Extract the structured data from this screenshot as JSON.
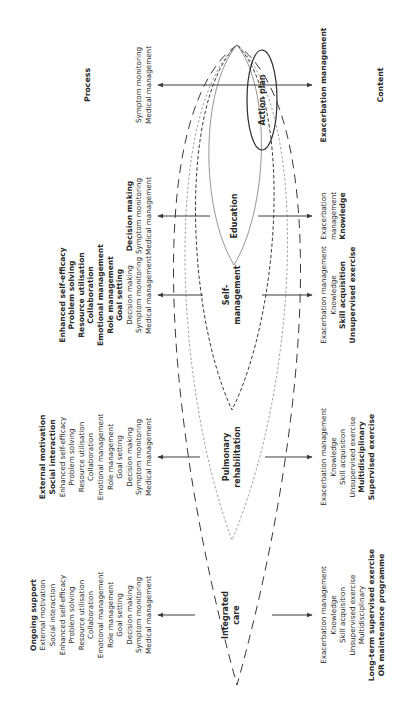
{
  "diagram": {
    "axis_labels": {
      "process": "Process",
      "content": "Content"
    },
    "levels": [
      {
        "id": "action-plan",
        "label_lines": [
          "Action plan"
        ],
        "process": [
          {
            "text": "Symptom monitoring",
            "bold": false
          },
          {
            "text": "Medical management",
            "bold": false
          }
        ],
        "content": [
          {
            "text": "Exacerbation management",
            "bold": true
          }
        ]
      },
      {
        "id": "education",
        "label_lines": [
          "Education"
        ],
        "process": [
          {
            "text": "Decision making",
            "bold": true
          },
          {
            "text": "Symptom monitoring",
            "bold": false
          },
          {
            "text": "Medical management",
            "bold": false
          }
        ],
        "content": [
          {
            "text": "Exacerbation",
            "bold": false
          },
          {
            "text": "management",
            "bold": false
          },
          {
            "text": "Knowledge",
            "bold": true
          }
        ]
      },
      {
        "id": "self-management",
        "label_lines": [
          "Self-",
          "management"
        ],
        "process": [
          {
            "text": "Enhanced self-efficacy",
            "bold": true
          },
          {
            "text": "Problem solving",
            "bold": true
          },
          {
            "text": "Resource utilisation",
            "bold": true
          },
          {
            "text": "Collaboration",
            "bold": true
          },
          {
            "text": "Emotional management",
            "bold": true
          },
          {
            "text": "Role management",
            "bold": true
          },
          {
            "text": "Goal setting",
            "bold": true
          },
          {
            "text": "Decision making",
            "bold": false
          },
          {
            "text": "Symptom monitoring",
            "bold": false
          },
          {
            "text": "Medical management",
            "bold": false
          }
        ],
        "content": [
          {
            "text": "Exacerbation management",
            "bold": false
          },
          {
            "text": "Knowledge",
            "bold": false
          },
          {
            "text": "Skill acquisition",
            "bold": true
          },
          {
            "text": "Unsupervised exercise",
            "bold": true
          }
        ]
      },
      {
        "id": "pulmonary-rehabilitation",
        "label_lines": [
          "Pulmonary",
          "rehabilitation"
        ],
        "process": [
          {
            "text": "External motivation",
            "bold": true
          },
          {
            "text": "Social interaction",
            "bold": true
          },
          {
            "text": "Enhanced self-efficacy",
            "bold": false
          },
          {
            "text": "Problem solving",
            "bold": false
          },
          {
            "text": "Resource utilisation",
            "bold": false
          },
          {
            "text": "Collaboration",
            "bold": false
          },
          {
            "text": "Emotional management",
            "bold": false
          },
          {
            "text": "Role management",
            "bold": false
          },
          {
            "text": "Goal setting",
            "bold": false
          },
          {
            "text": "Decision making",
            "bold": false
          },
          {
            "text": "Symptom monitoring",
            "bold": false
          },
          {
            "text": "Medical management",
            "bold": false
          }
        ],
        "content": [
          {
            "text": "Exacerbation management",
            "bold": false
          },
          {
            "text": "Knowledge",
            "bold": false
          },
          {
            "text": "Skill acquisition",
            "bold": false
          },
          {
            "text": "Unsupervised exercise",
            "bold": false
          },
          {
            "text": "Multidisciplinary",
            "bold": true
          },
          {
            "text": "Supervised exercise",
            "bold": true
          }
        ]
      },
      {
        "id": "integrated-care",
        "label_lines": [
          "Integrated",
          "care"
        ],
        "process": [
          {
            "text": "Ongoing support",
            "bold": true
          },
          {
            "text": "External motivation",
            "bold": false
          },
          {
            "text": "Social interaction",
            "bold": false
          },
          {
            "text": "Enhanced self-efficacy",
            "bold": false
          },
          {
            "text": "Problem solving",
            "bold": false
          },
          {
            "text": "Resource utilisation",
            "bold": false
          },
          {
            "text": "Collaboration",
            "bold": false
          },
          {
            "text": "Emotional management",
            "bold": false
          },
          {
            "text": "Role management",
            "bold": false
          },
          {
            "text": "Goal setting",
            "bold": false
          },
          {
            "text": "Decision making",
            "bold": false
          },
          {
            "text": "Symptom monitoring",
            "bold": false
          },
          {
            "text": "Medical management",
            "bold": false
          }
        ],
        "content": [
          {
            "text": "Exacerbation management",
            "bold": false
          },
          {
            "text": "Knowledge",
            "bold": false
          },
          {
            "text": "Skill acquisition",
            "bold": false
          },
          {
            "text": "Unsupervised exercise",
            "bold": false
          },
          {
            "text": "Multidisciplinary",
            "bold": false
          },
          {
            "text": "Long-term supervised exercise",
            "bold": true
          },
          {
            "text": "OR maintenance programme",
            "bold": true
          }
        ]
      }
    ],
    "colors": {
      "line": "#3a3a3a",
      "text": "#2a2a2a",
      "light_line": "#8a8a8a",
      "background": "#ffffff"
    }
  }
}
